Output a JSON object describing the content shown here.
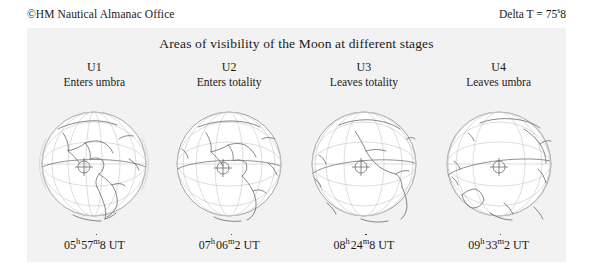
{
  "header": {
    "credit": "©HM Nautical Almanac Office",
    "delta_t_label": "Delta T =",
    "delta_t_value_int": "75",
    "delta_t_unit": "s",
    "delta_t_value_frac": "8"
  },
  "title": "Areas of visibility of the Moon at different stages",
  "colors": {
    "panel_background": "#f2f2f2",
    "page_background": "#ffffff",
    "text": "#1a1a1a",
    "globe_outline": "#8d8d8d",
    "graticule": "#bdbdbd",
    "coastline": "#5b5b5b",
    "terminator": "#7a7a7a"
  },
  "stages": [
    {
      "code": "U1",
      "description": "Enters umbra",
      "time_hours": "05",
      "time_minutes": "57",
      "time_fraction": "8",
      "time_scale": "UT",
      "hour_unit": "h",
      "minute_unit": "m",
      "globe_center_longitude": -60,
      "sublunar_marker": "circle-cross"
    },
    {
      "code": "U2",
      "description": "Enters totality",
      "time_hours": "07",
      "time_minutes": "06",
      "time_fraction": "2",
      "time_scale": "UT",
      "hour_unit": "h",
      "minute_unit": "m",
      "globe_center_longitude": -78,
      "sublunar_marker": "circle-cross"
    },
    {
      "code": "U3",
      "description": "Leaves totality",
      "time_hours": "08",
      "time_minutes": "24",
      "time_fraction": "8",
      "time_scale": "UT",
      "hour_unit": "h",
      "minute_unit": "m",
      "globe_center_longitude": -98,
      "sublunar_marker": "circle-cross"
    },
    {
      "code": "U4",
      "description": "Leaves umbra",
      "time_hours": "09",
      "time_minutes": "33",
      "time_fraction": "2",
      "time_scale": "UT",
      "hour_unit": "h",
      "minute_unit": "m",
      "globe_center_longitude": -118,
      "sublunar_marker": "circle-cross"
    }
  ]
}
